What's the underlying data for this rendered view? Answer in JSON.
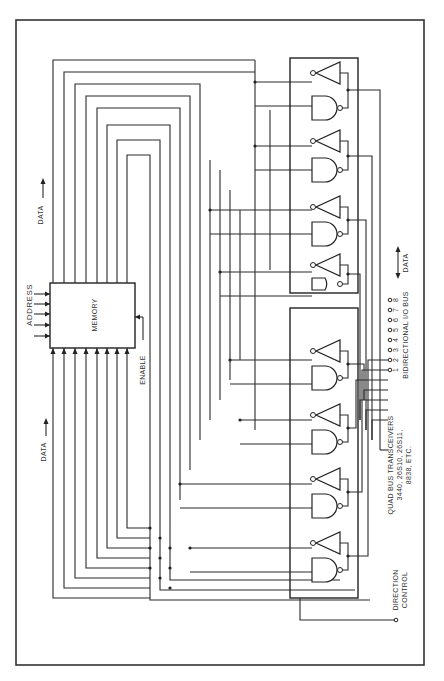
{
  "diagram": {
    "orientation": "rotated 90deg clockwise",
    "labels": {
      "address": "ADDRESS",
      "memory": "MEMORY",
      "enable": "ENABLE",
      "data_top": "DATA",
      "data_bottom": "DATA",
      "data_bidir": "DATA",
      "bus_title": "BIDIRECTIONAL I/O BUS",
      "transceiver_title": "QUAD BUS TRANSCEIVERS",
      "transceiver_parts_1": "3440, 26S10, 26S11,",
      "transceiver_parts_2": "8838, ETC.",
      "direction_control_1": "DIRECTION",
      "direction_control_2": "CONTROL"
    },
    "bus_pins": [
      "1",
      "2",
      "3",
      "4",
      "5",
      "6",
      "7",
      "8"
    ],
    "components": {
      "memory_block": {
        "address_inputs": 5,
        "data_outputs": 8,
        "data_inputs": 8
      },
      "transceiver_packages": 2,
      "transceivers_per_package": 4
    }
  }
}
